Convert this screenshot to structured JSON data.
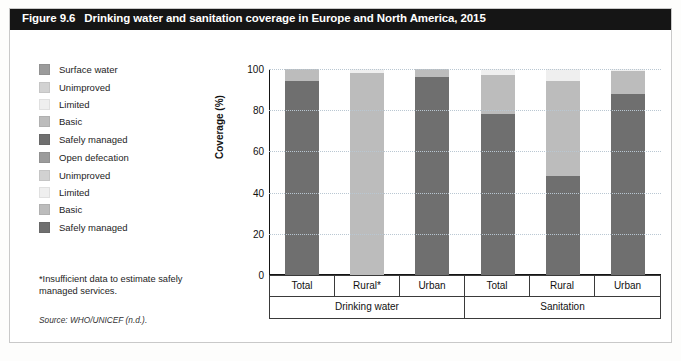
{
  "figure": {
    "number": "Figure 9.6",
    "title": "Drinking water and sanitation coverage in Europe and North America, 2015",
    "footnote": "*Insufficient data to estimate safely managed services.",
    "source": "Source: WHO/UNICEF (n.d.)."
  },
  "colors": {
    "surface_water": "#9b9b9b",
    "unimproved": "#d2d2d2",
    "limited": "#efefef",
    "basic": "#bcbcbc",
    "safely_managed": "#6f6f6f",
    "open_defecation": "#9b9b9b",
    "title_bar": "#151515",
    "grid": "#b9c7d2",
    "axis": "#151515"
  },
  "legend": {
    "groups": [
      {
        "name": "drinking-water",
        "items": [
          {
            "label": "Surface water",
            "color": "#9b9b9b"
          },
          {
            "label": "Unimproved",
            "color": "#d2d2d2"
          },
          {
            "label": "Limited",
            "color": "#efefef"
          },
          {
            "label": "Basic",
            "color": "#bcbcbc"
          },
          {
            "label": "Safely managed",
            "color": "#6f6f6f"
          }
        ]
      },
      {
        "name": "sanitation",
        "items": [
          {
            "label": "Open defecation",
            "color": "#9b9b9b"
          },
          {
            "label": "Unimproved",
            "color": "#d2d2d2"
          },
          {
            "label": "Limited",
            "color": "#efefef"
          },
          {
            "label": "Basic",
            "color": "#bcbcbc"
          },
          {
            "label": "Safely managed",
            "color": "#6f6f6f"
          }
        ]
      }
    ]
  },
  "chart_data": {
    "type": "bar",
    "stacked": true,
    "title": "Drinking water and sanitation coverage in Europe and North America, 2015",
    "xlabel": "",
    "ylabel": "Coverage (%)",
    "ylim": [
      0,
      100
    ],
    "yticks": [
      0,
      20,
      40,
      60,
      80,
      100
    ],
    "grid": true,
    "legend_position": "left",
    "categories": [
      "Total",
      "Rural*",
      "Urban",
      "Total",
      "Rural",
      "Urban"
    ],
    "groups": [
      {
        "label": "Drinking water",
        "span": 3
      },
      {
        "label": "Sanitation",
        "span": 3
      }
    ],
    "series": [
      {
        "name": "Safely managed",
        "color": "#6f6f6f",
        "values": [
          94,
          0,
          96,
          78,
          48,
          88
        ]
      },
      {
        "name": "Basic",
        "color": "#bcbcbc",
        "values": [
          6,
          98,
          4,
          19,
          46,
          11
        ]
      },
      {
        "name": "Limited",
        "color": "#efefef",
        "values": [
          0,
          2,
          0,
          3,
          6,
          1
        ]
      },
      {
        "name": "Unimproved",
        "color": "#d2d2d2",
        "values": [
          0,
          0,
          0,
          0,
          0,
          0
        ]
      },
      {
        "name": "Surface water",
        "color": "#9b9b9b",
        "values": [
          0,
          0,
          0,
          0,
          0,
          0
        ]
      }
    ]
  }
}
